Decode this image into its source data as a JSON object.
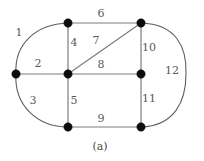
{
  "figure": {
    "caption": "(a)",
    "caption_x": 100,
    "caption_y": 147,
    "width": 204,
    "height": 161,
    "background_color": "#ffffff",
    "edge_color": "#7d7d7d",
    "arc_color": "#5f5f5f",
    "vertex_color": "#0d0d0d",
    "label_color": "#5a5a5a"
  },
  "graph": {
    "type": "planar-graph-diagram",
    "vertex_radius": 4.2,
    "vertices": [
      {
        "id": "v-left",
        "name": "vertex-left",
        "x": 16,
        "y": 74
      },
      {
        "id": "v-top-left",
        "name": "vertex-top-left",
        "x": 68,
        "y": 23
      },
      {
        "id": "v-center",
        "name": "vertex-center",
        "x": 68,
        "y": 74
      },
      {
        "id": "v-bottom-left",
        "name": "vertex-bottom-left",
        "x": 68,
        "y": 127
      },
      {
        "id": "v-top-right",
        "name": "vertex-top-right",
        "x": 141,
        "y": 23
      },
      {
        "id": "v-right",
        "name": "vertex-right",
        "x": 141,
        "y": 74
      },
      {
        "id": "v-bottom-right",
        "name": "vertex-bottom-right",
        "x": 141,
        "y": 127
      }
    ],
    "edges": [
      {
        "label": "1",
        "name": "edge-1",
        "from": "v-left",
        "to": "v-top-left",
        "shape": "arc",
        "path": "M 16 74 C 14 44 36 24 68 23",
        "label_x": 19,
        "label_y": 33
      },
      {
        "label": "2",
        "name": "edge-2",
        "from": "v-left",
        "to": "v-center",
        "shape": "line",
        "path": "M 16 74 L 68 74",
        "label_x": 38,
        "label_y": 64
      },
      {
        "label": "3",
        "name": "edge-3",
        "from": "v-left",
        "to": "v-bottom-left",
        "shape": "arc",
        "path": "M 16 74 C 14 105 37 127 68 127",
        "label_x": 33,
        "label_y": 101
      },
      {
        "label": "4",
        "name": "edge-4",
        "from": "v-top-left",
        "to": "v-center",
        "shape": "line",
        "path": "M 68 23 L 68 74",
        "label_x": 74,
        "label_y": 43
      },
      {
        "label": "5",
        "name": "edge-5",
        "from": "v-center",
        "to": "v-bottom-left",
        "shape": "line",
        "path": "M 68 74 L 68 127",
        "label_x": 74,
        "label_y": 101
      },
      {
        "label": "6",
        "name": "edge-6",
        "from": "v-top-left",
        "to": "v-top-right",
        "shape": "line",
        "path": "M 68 23 L 141 23",
        "label_x": 101,
        "label_y": 14
      },
      {
        "label": "7",
        "name": "edge-7",
        "from": "v-center",
        "to": "v-top-right",
        "shape": "line",
        "path": "M 68 74 L 141 23",
        "label_x": 96,
        "label_y": 41
      },
      {
        "label": "8",
        "name": "edge-8",
        "from": "v-center",
        "to": "v-right",
        "shape": "line",
        "path": "M 68 74 L 141 74",
        "label_x": 101,
        "label_y": 65
      },
      {
        "label": "9",
        "name": "edge-9",
        "from": "v-bottom-left",
        "to": "v-bottom-right",
        "shape": "line",
        "path": "M 68 127 L 141 127",
        "label_x": 101,
        "label_y": 119
      },
      {
        "label": "10",
        "name": "edge-10",
        "from": "v-top-right",
        "to": "v-right",
        "shape": "line",
        "path": "M 141 23 L 141 74",
        "label_x": 149,
        "label_y": 48
      },
      {
        "label": "11",
        "name": "edge-11",
        "from": "v-right",
        "to": "v-bottom-right",
        "shape": "line",
        "path": "M 141 74 L 141 127",
        "label_x": 149,
        "label_y": 99
      },
      {
        "label": "12",
        "name": "edge-12",
        "from": "v-top-right",
        "to": "v-bottom-right",
        "shape": "arc",
        "path": "M 141 23 C 176 24 187 47 186 74 C 186 102 174 126 141 127",
        "label_x": 172,
        "label_y": 71
      }
    ]
  }
}
